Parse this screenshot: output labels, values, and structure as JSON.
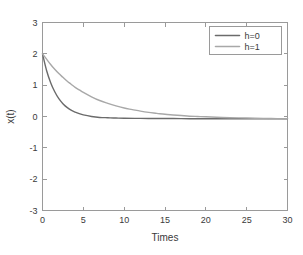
{
  "chart_data": {
    "type": "line",
    "title": "",
    "xlabel": "Times",
    "ylabel": "x(t)",
    "xlim": [
      0,
      30
    ],
    "ylim": [
      -3,
      3
    ],
    "xticks": [
      0,
      5,
      10,
      15,
      20,
      25,
      30
    ],
    "yticks": [
      3,
      2,
      1,
      0,
      -1,
      -2,
      -3
    ],
    "xtick_labels": [
      "0",
      "5",
      "10",
      "15",
      "20",
      "25",
      "30"
    ],
    "ytick_labels": [
      "3",
      "2",
      "1",
      "0",
      "-1",
      "-2",
      "-3"
    ],
    "grid": false,
    "legend_position": "top-right",
    "background": "#ffffff",
    "frame_color": "#9a9a9a",
    "series": [
      {
        "name": "h=0",
        "color": "#6b6b6b",
        "line_width": 1.4,
        "x": [
          0,
          0.5,
          1,
          1.5,
          2,
          2.5,
          3,
          3.5,
          4,
          4.5,
          5,
          6,
          7,
          8,
          9,
          10,
          12,
          14,
          16,
          18,
          20,
          22,
          24,
          26,
          28,
          30
        ],
        "y": [
          2.0,
          1.47,
          1.08,
          0.79,
          0.57,
          0.41,
          0.29,
          0.2,
          0.14,
          0.09,
          0.05,
          0.0,
          -0.03,
          -0.04,
          -0.05,
          -0.055,
          -0.06,
          -0.065,
          -0.065,
          -0.07,
          -0.07,
          -0.07,
          -0.07,
          -0.07,
          -0.07,
          -0.07
        ]
      },
      {
        "name": "h=1",
        "color": "#a8a8a8",
        "line_width": 1.4,
        "x": [
          0,
          0.5,
          1,
          1.5,
          2,
          2.5,
          3,
          3.5,
          4,
          4.5,
          5,
          6,
          7,
          8,
          9,
          10,
          11,
          12,
          13,
          14,
          15,
          16,
          17,
          18,
          19,
          20,
          22,
          24,
          26,
          28,
          30
        ],
        "y": [
          2.0,
          1.83,
          1.66,
          1.51,
          1.37,
          1.25,
          1.13,
          1.03,
          0.93,
          0.85,
          0.77,
          0.63,
          0.51,
          0.42,
          0.34,
          0.27,
          0.22,
          0.17,
          0.13,
          0.1,
          0.07,
          0.05,
          0.03,
          0.01,
          0.0,
          -0.01,
          -0.03,
          -0.045,
          -0.055,
          -0.065,
          -0.07
        ]
      }
    ],
    "legend_entries": [
      {
        "label": "h=0",
        "color": "#6b6b6b"
      },
      {
        "label": "h=1",
        "color": "#a8a8a8"
      }
    ],
    "annotations": []
  }
}
